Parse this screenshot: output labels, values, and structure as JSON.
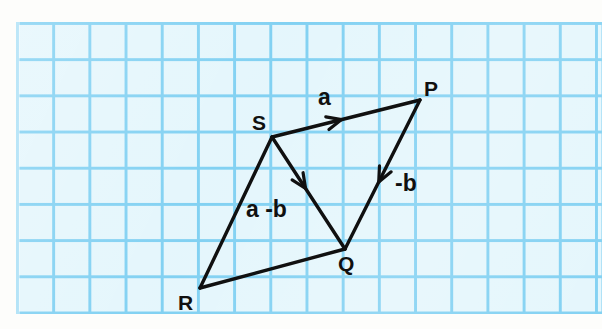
{
  "figure": {
    "kind": "vector-diagram-on-graph-paper",
    "background": {
      "paper_fill": "#e4f6fc",
      "grid_line_color": "#7fd0f2",
      "page_margin_color": "#fdfdfb",
      "grid_cell_px": 36
    },
    "ink_color": "#101010"
  },
  "points": [
    {
      "id": "P",
      "label": "P",
      "x": 420,
      "y": 100,
      "label_x": 424,
      "label_y": 78
    },
    {
      "id": "S",
      "label": "S",
      "x": 272,
      "y": 137,
      "label_x": 252,
      "label_y": 112
    },
    {
      "id": "Q",
      "label": "Q",
      "x": 345,
      "y": 249,
      "label_x": 338,
      "label_y": 253
    },
    {
      "id": "R",
      "label": "R",
      "x": 200,
      "y": 288,
      "label_x": 178,
      "label_y": 292
    }
  ],
  "edges": [
    {
      "id": "SP",
      "from": "S",
      "to": "P",
      "arrow": true,
      "arrow_t": 0.47,
      "label": "a",
      "label_x": 318,
      "label_y": 86
    },
    {
      "id": "PQ",
      "from": "P",
      "to": "Q",
      "arrow": true,
      "arrow_t": 0.55,
      "label": "-b",
      "label_x": 395,
      "label_y": 172
    },
    {
      "id": "SQ",
      "from": "S",
      "to": "Q",
      "arrow": true,
      "arrow_t": 0.46,
      "label": "",
      "label_x": 0,
      "label_y": 0
    },
    {
      "id": "SR",
      "from": "S",
      "to": "R",
      "arrow": false,
      "arrow_t": 0,
      "label": "a -b",
      "label_x": 246,
      "label_y": 198
    },
    {
      "id": "RQ",
      "from": "R",
      "to": "Q",
      "arrow": false,
      "arrow_t": 0,
      "label": "",
      "label_x": 0,
      "label_y": 0
    }
  ],
  "labels": {
    "vertex_P": "P",
    "vertex_S": "S",
    "vertex_Q": "Q",
    "vertex_R": "R",
    "vector_a": "a",
    "vector_minus_b": "-b",
    "vector_a_minus_b": "a -b"
  }
}
